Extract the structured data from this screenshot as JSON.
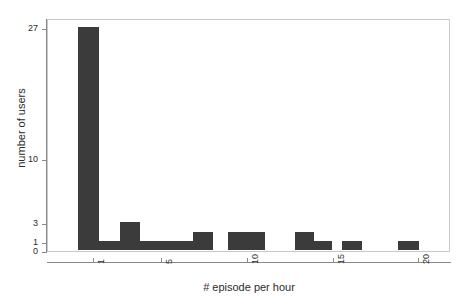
{
  "chart_data": {
    "type": "bar",
    "title": "",
    "subtitle": "",
    "xlabel": "# episode per hour",
    "ylabel": "number of users",
    "grid": false,
    "legend": null,
    "bar_color": "#3b3b3b",
    "background_color": "#ffffff",
    "frame_color": "#c9c9c9",
    "axis_color": "#8a8a8a",
    "xlim": [
      0,
      21.8
    ],
    "ylim": [
      0,
      27
    ],
    "yscale": "nonlinear-compressed",
    "xticks": [
      1,
      5,
      10,
      15,
      20
    ],
    "xtick_labels": [
      "1",
      "5",
      "10",
      "15",
      "20"
    ],
    "yticks": [
      0,
      1,
      3,
      10,
      27
    ],
    "ytick_labels": [
      "0",
      "1",
      "3",
      "10",
      "27"
    ],
    "categories": [
      1,
      2,
      3,
      4,
      5,
      6,
      7,
      8,
      9,
      10,
      11,
      12,
      13,
      14,
      15,
      16,
      17,
      18,
      19,
      20
    ],
    "values": [
      27,
      1,
      3,
      1,
      1,
      1,
      0,
      2,
      0,
      2,
      2,
      0,
      2,
      1,
      1,
      1,
      0,
      0,
      0,
      1
    ],
    "bars": [
      {
        "x": 1,
        "value": 27,
        "left_px": 77,
        "width_px": 21
      },
      {
        "x": 2,
        "value": 1,
        "left_px": 98,
        "width_px": 21
      },
      {
        "x": 3,
        "value": 3,
        "left_px": 119,
        "width_px": 20
      },
      {
        "x": 4,
        "value": 1,
        "left_px": 139,
        "width_px": 20
      },
      {
        "x": 5,
        "value": 1,
        "left_px": 159,
        "width_px": 20
      },
      {
        "x": 6,
        "value": 1,
        "left_px": 179,
        "width_px": 0
      },
      {
        "x": 8,
        "value": 2,
        "left_px": 192,
        "width_px": 20
      },
      {
        "x": 10,
        "value": 2,
        "left_px": 227,
        "width_px": 19
      },
      {
        "x": 11,
        "value": 2,
        "left_px": 246,
        "width_px": 18
      },
      {
        "x": 13,
        "value": 2,
        "left_px": 294,
        "width_px": 19
      },
      {
        "x": 14,
        "value": 1,
        "left_px": 313,
        "width_px": 18
      },
      {
        "x": 16,
        "value": 1,
        "left_px": 341,
        "width_px": 20
      },
      {
        "x": 20,
        "value": 1,
        "left_px": 397,
        "width_px": 21
      }
    ]
  },
  "axes": {
    "y_title": "number of users",
    "x_title": "# episode per hour",
    "y_ticks": [
      {
        "label": "27",
        "top_px": 29
      },
      {
        "label": "10",
        "top_px": 160
      },
      {
        "label": "3",
        "top_px": 224
      },
      {
        "label": "1",
        "top_px": 243
      },
      {
        "label": "0",
        "top_px": 252
      }
    ],
    "x_ticks": [
      {
        "label": "1",
        "left_px": 93
      },
      {
        "label": "5",
        "left_px": 161
      },
      {
        "label": "10",
        "left_px": 247
      },
      {
        "label": "15",
        "left_px": 333
      },
      {
        "label": "20",
        "left_px": 418
      }
    ]
  }
}
